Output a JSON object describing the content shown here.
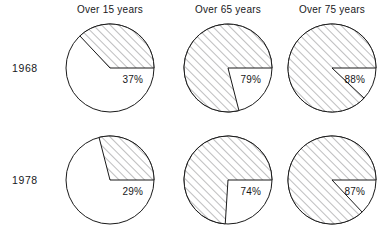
{
  "figure": {
    "title": "",
    "background_color": "#ffffff",
    "line_color": "#1a1a1a",
    "hatch_color": "#6e6e72",
    "fill_color": "#ffffff"
  },
  "columns": [
    {
      "label": "Over 15 years"
    },
    {
      "label": "Over 65 years"
    },
    {
      "label": "Over 75 years"
    }
  ],
  "rows": [
    {
      "label": "1968"
    },
    {
      "label": "1978"
    }
  ],
  "chart_data": {
    "type": "pie",
    "title": "",
    "xlabel": "",
    "ylabel": "",
    "legend": [],
    "grid": false,
    "note": "Matrix of 6 pie charts. Each pie shows one hatched (shaded) wedge whose size equals the stated percentage. Wedges begin at the 3 o'clock position and sweep counter-clockwise. The percentage label is printed just below the horizontal radius, inside the circle near the right edge.",
    "categories": [
      "Over 15 years",
      "Over 65 years",
      "Over 75 years"
    ],
    "series": [
      {
        "name": "1968",
        "values": [
          37,
          79,
          88
        ]
      },
      {
        "name": "1978",
        "values": [
          29,
          74,
          87
        ]
      }
    ],
    "pies": [
      {
        "row": "1968",
        "column": "Over 15 years",
        "value": 37,
        "label": "37%",
        "slices": [
          {
            "name": "shaded",
            "value": 37,
            "style": "hatched"
          },
          {
            "name": "unshaded",
            "value": 63,
            "style": "plain"
          }
        ]
      },
      {
        "row": "1968",
        "column": "Over 65 years",
        "value": 79,
        "label": "79%",
        "slices": [
          {
            "name": "shaded",
            "value": 79,
            "style": "hatched"
          },
          {
            "name": "unshaded",
            "value": 21,
            "style": "plain"
          }
        ]
      },
      {
        "row": "1968",
        "column": "Over 75 years",
        "value": 88,
        "label": "88%",
        "slices": [
          {
            "name": "shaded",
            "value": 88,
            "style": "hatched"
          },
          {
            "name": "unshaded",
            "value": 12,
            "style": "plain"
          }
        ]
      },
      {
        "row": "1978",
        "column": "Over 15 years",
        "value": 29,
        "label": "29%",
        "slices": [
          {
            "name": "shaded",
            "value": 29,
            "style": "hatched"
          },
          {
            "name": "unshaded",
            "value": 71,
            "style": "plain"
          }
        ]
      },
      {
        "row": "1978",
        "column": "Over 65 years",
        "value": 74,
        "label": "74%",
        "slices": [
          {
            "name": "shaded",
            "value": 74,
            "style": "hatched"
          },
          {
            "name": "unshaded",
            "value": 26,
            "style": "plain"
          }
        ]
      },
      {
        "row": "1978",
        "column": "Over 75 years",
        "value": 87,
        "label": "87%",
        "slices": [
          {
            "name": "shaded",
            "value": 87,
            "style": "hatched"
          },
          {
            "name": "unshaded",
            "value": 13,
            "style": "plain"
          }
        ]
      }
    ]
  },
  "layout": {
    "column_centers_x": [
      110,
      228,
      332
    ],
    "row_centers_y": [
      68,
      180
    ],
    "pie_radius": 44
  }
}
